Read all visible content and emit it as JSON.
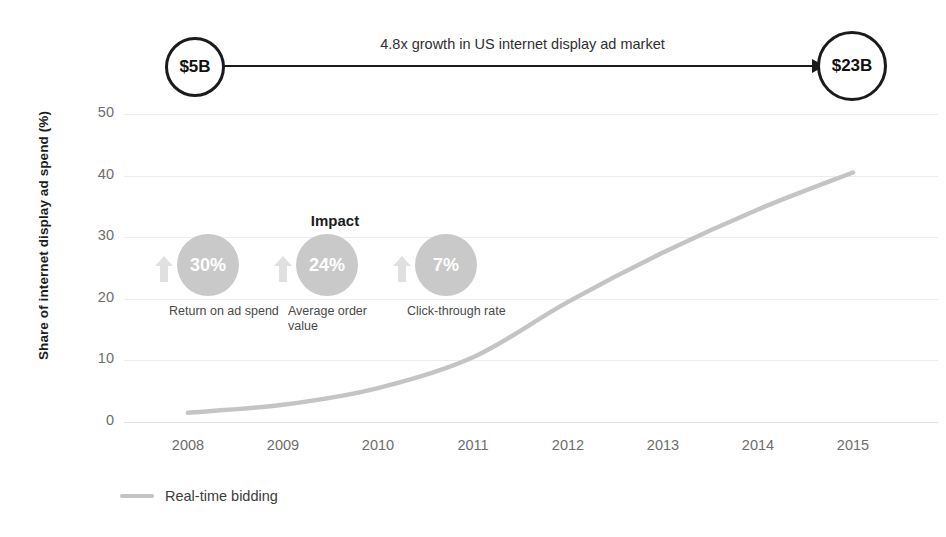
{
  "banner": {
    "start_value": "$5B",
    "end_value": "$23B",
    "label": "4.8x growth in US internet display ad market"
  },
  "impact": {
    "title": "Impact",
    "items": [
      {
        "value": "30%",
        "caption": "Return on ad spend",
        "icon": "up-arrow-icon"
      },
      {
        "value": "24%",
        "caption": "Average order value",
        "icon": "up-arrow-icon"
      },
      {
        "value": "7%",
        "caption": "Click-through rate",
        "icon": "up-arrow-icon"
      }
    ]
  },
  "legend": {
    "items": [
      {
        "label": "Real-time bidding",
        "color": "#c4c4c4"
      }
    ]
  },
  "chart_data": {
    "type": "line",
    "title": "",
    "xlabel": "",
    "ylabel": "Share of internet display ad spend (%)",
    "categories": [
      "2008",
      "2009",
      "2010",
      "2011",
      "2012",
      "2013",
      "2014",
      "2015"
    ],
    "x": [
      2008,
      2009,
      2010,
      2011,
      2012,
      2013,
      2014,
      2015
    ],
    "series": [
      {
        "name": "Real-time bidding",
        "color": "#c4c4c4",
        "values": [
          1.5,
          2.8,
          5.5,
          10.5,
          19.5,
          27.5,
          34.5,
          40.5
        ]
      }
    ],
    "ylim": [
      0,
      50
    ],
    "yticks": [
      0,
      10,
      20,
      30,
      40,
      50
    ],
    "ytick_labels": [
      "0",
      "10",
      "20",
      "30",
      "40",
      "50"
    ],
    "grid": true,
    "legend_position": "bottom-left"
  }
}
